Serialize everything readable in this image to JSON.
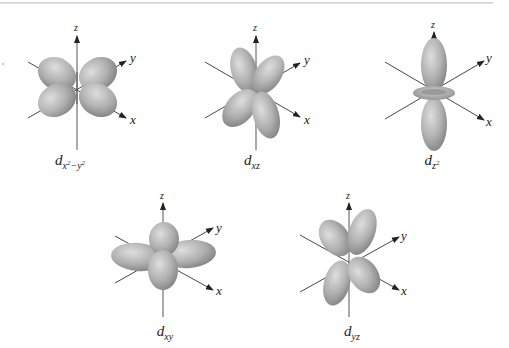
{
  "figure": {
    "colors": {
      "lobe_light": "#d4d4d4",
      "lobe_mid": "#a8a8a8",
      "lobe_dark": "#7a7a7a",
      "axis": "#222222",
      "rule": "#d0d0d0"
    },
    "axis_labels": {
      "x": "x",
      "y": "y",
      "z": "z"
    },
    "orbitals": [
      {
        "id": "dx2-y2",
        "base": "d",
        "sub": "x",
        "sub_sup1": "2",
        "sub_mid": "−y",
        "sub_sup2": "2"
      },
      {
        "id": "dxz",
        "base": "d",
        "sub": "xz"
      },
      {
        "id": "dz2",
        "base": "d",
        "sub": "z",
        "sub_sup": "2"
      },
      {
        "id": "dxy",
        "base": "d",
        "sub": "xy"
      },
      {
        "id": "dyz",
        "base": "d",
        "sub": "yz"
      }
    ]
  }
}
